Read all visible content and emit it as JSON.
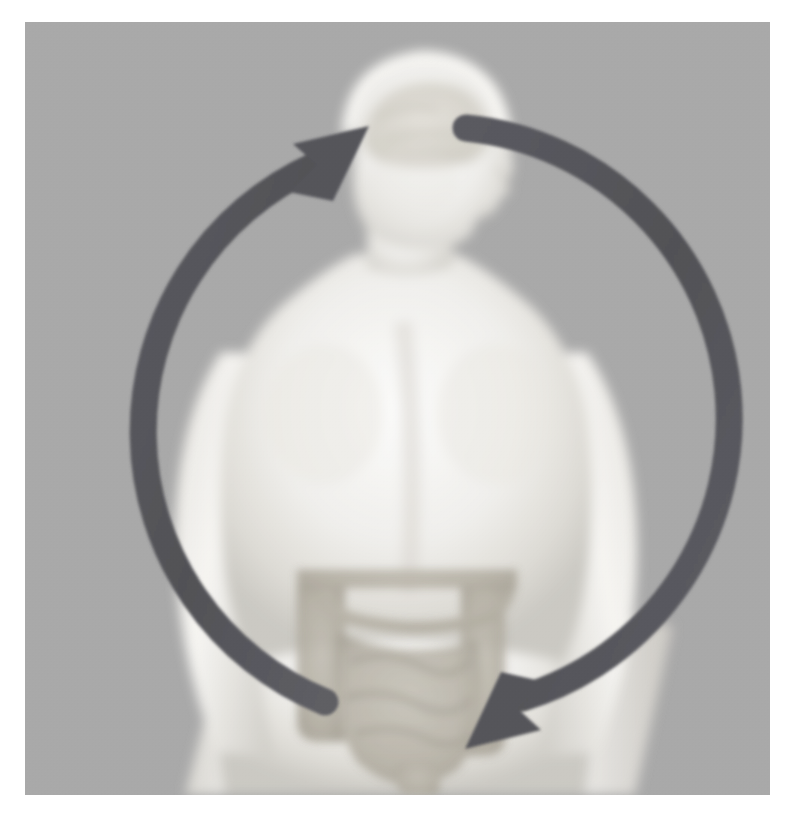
{
  "image": {
    "title": "Gut-brain axis illustration",
    "domain": "medical-illustration",
    "alt_text": "Grayscale human body seen from behind with head in profile; a circular two-headed arrow links the brain and the intestines",
    "width": 790,
    "height": 830,
    "frame": {
      "x": 25,
      "y": 22,
      "width": 745,
      "height": 773
    }
  },
  "colors": {
    "page_background": "#ffffff",
    "photo_background": "#a9a9a9",
    "body_light": "#f2f2f0",
    "body_mid": "#dedcd8",
    "body_shadow": "#c9c7c2",
    "skull_outline": "#f7f6f3",
    "brain_tone": "#d9d6cf",
    "intestine_tone": "#b5b1a6",
    "intestine_dark": "#a39e92",
    "arrow_gray": "#555559",
    "arrow_gray_light": "#63636a"
  },
  "subject": {
    "label": "human-body-silhouette",
    "view": "posterior view, head turned to profile facing right",
    "parts": [
      {
        "name": "head",
        "label": "Head with translucent skull"
      },
      {
        "name": "brain",
        "label": "Brain"
      },
      {
        "name": "face-profile",
        "label": "Face in profile (nose, lips, chin)"
      },
      {
        "name": "neck",
        "label": "Neck"
      },
      {
        "name": "shoulders",
        "label": "Shoulders"
      },
      {
        "name": "torso-back",
        "label": "Upper back / torso"
      },
      {
        "name": "left-arm",
        "label": "Left arm"
      },
      {
        "name": "right-arm",
        "label": "Right arm"
      },
      {
        "name": "abdomen",
        "label": "Abdomen"
      },
      {
        "name": "intestines",
        "label": "Large and small intestines"
      },
      {
        "name": "hips",
        "label": "Hips / pelvis"
      },
      {
        "name": "legs",
        "label": "Upper legs"
      }
    ]
  },
  "annotation": {
    "name": "gut-brain-axis-cycle-arrow",
    "type": "circular double-headed arrow",
    "meaning": "Bidirectional communication between the brain and the gut",
    "geometry": {
      "center_x": 398,
      "center_y": 418,
      "radius_x": 292,
      "radius_y": 292,
      "stroke_width": 27
    },
    "arrowheads": [
      {
        "name": "upward-arrowhead",
        "position": "top-left, pointing toward the brain",
        "direction": "gut-to-brain",
        "x": 310,
        "y": 135
      },
      {
        "name": "downward-arrowhead",
        "position": "bottom-right, pointing toward the intestines",
        "direction": "brain-to-gut",
        "x": 478,
        "y": 707
      }
    ],
    "tails": [
      {
        "name": "upper-right-tail",
        "x": 465,
        "y": 125
      },
      {
        "name": "lower-left-tail",
        "x": 323,
        "y": 695
      }
    ]
  }
}
